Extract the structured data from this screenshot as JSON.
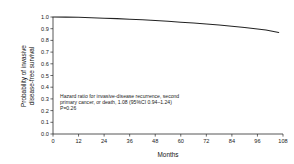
{
  "chart_data": {
    "type": "line",
    "title": "",
    "subtitle": "",
    "xlabel": "Months",
    "ylabel": "Probability of invasive disease-free survival",
    "ylabel_line1": "Probability of invasive",
    "ylabel_line2": "disease-free survival",
    "xlim": [
      0,
      108
    ],
    "ylim": [
      0.0,
      1.0
    ],
    "grid": false,
    "legend_position": "none",
    "x_ticks": [
      0,
      12,
      24,
      36,
      48,
      60,
      72,
      84,
      96,
      108
    ],
    "x_tick_labels": [
      "0",
      "12",
      "24",
      "36",
      "48",
      "60",
      "72",
      "84",
      "96",
      "108"
    ],
    "y_ticks": [
      0.0,
      0.1,
      0.2,
      0.3,
      0.4,
      0.5,
      0.6,
      0.7,
      0.8,
      0.9,
      1.0
    ],
    "y_tick_labels": [
      "0.0",
      "0.1",
      "0.2",
      "0.3",
      "0.4",
      "0.5",
      "0.6",
      "0.7",
      "0.8",
      "0.9",
      "1.0"
    ],
    "series": [
      {
        "name": "Invasive disease-free survival",
        "color": "#232323",
        "x": [
          0,
          6,
          12,
          18,
          24,
          30,
          36,
          42,
          48,
          54,
          60,
          66,
          72,
          78,
          84,
          90,
          96,
          100,
          103,
          106
        ],
        "values": [
          1.0,
          0.999,
          0.997,
          0.994,
          0.99,
          0.986,
          0.981,
          0.976,
          0.97,
          0.963,
          0.956,
          0.948,
          0.94,
          0.931,
          0.921,
          0.91,
          0.898,
          0.889,
          0.879,
          0.868
        ]
      }
    ],
    "annotations": [
      {
        "name": "hazard-ratio-annotation",
        "lines": [
          "Hazard ratio for invasive-disease recurrence, second",
          "primary cancer, or death, 1.08 (95%CI  0.94–1.24)",
          "P=0.26"
        ]
      }
    ]
  }
}
